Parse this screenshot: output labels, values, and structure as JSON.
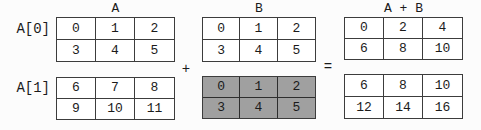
{
  "figure": {
    "column_headers": [
      {
        "label": "A"
      },
      {
        "label": "B"
      },
      {
        "label": "A + B"
      }
    ],
    "row_labels": [
      {
        "label": "A[0]"
      },
      {
        "label": "A[1]"
      }
    ],
    "operators": {
      "plus": "+",
      "equals": "="
    },
    "matrices": {
      "a0": {
        "rows": [
          [
            "0",
            "1",
            "2"
          ],
          [
            "3",
            "4",
            "5"
          ]
        ],
        "highlighted": false
      },
      "b_top": {
        "rows": [
          [
            "0",
            "1",
            "2"
          ],
          [
            "3",
            "4",
            "5"
          ]
        ],
        "highlighted": false
      },
      "sum_top": {
        "rows": [
          [
            "0",
            "2",
            "4"
          ],
          [
            "6",
            "8",
            "10"
          ]
        ],
        "highlighted": false
      },
      "a1": {
        "rows": [
          [
            "6",
            "7",
            "8"
          ],
          [
            "9",
            "10",
            "11"
          ]
        ],
        "highlighted": false
      },
      "b_bottom": {
        "rows": [
          [
            "0",
            "1",
            "2"
          ],
          [
            "3",
            "4",
            "5"
          ]
        ],
        "highlighted": true
      },
      "sum_bottom": {
        "rows": [
          [
            "6",
            "8",
            "10"
          ],
          [
            "12",
            "14",
            "16"
          ]
        ],
        "highlighted": false
      }
    },
    "colors": {
      "border": "#3c3c3c",
      "text": "#1b1b1b",
      "highlight_bg": "#a0a0a0",
      "background": "#fcfcfc",
      "cell_bg": "#ffffff"
    }
  }
}
